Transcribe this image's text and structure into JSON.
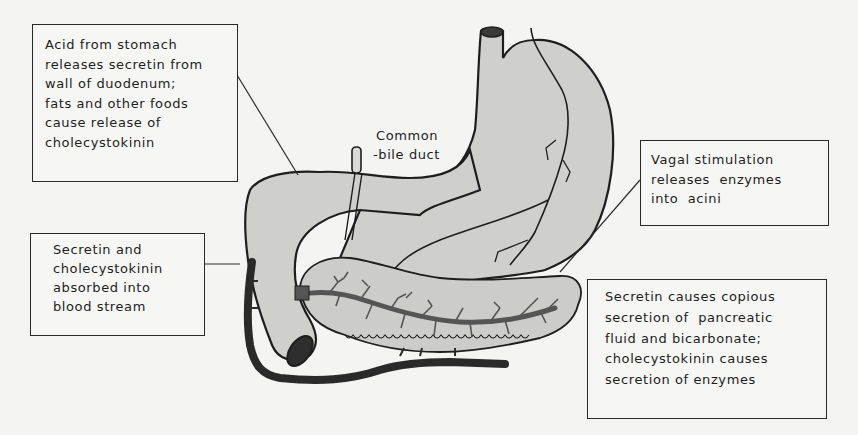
{
  "figure": {
    "structures": [
      "stomach",
      "esophagus",
      "duodenum",
      "pancreas",
      "pancreatic duct",
      "common bile duct",
      "blood vessel",
      "vagus nerve"
    ],
    "colors": {
      "paper": "#f4f4f2",
      "organ_fill": "#cfcfcc",
      "outline": "#1e1e1e",
      "duct": "#555555",
      "vessel": "#2a2a2a"
    }
  },
  "labels": {
    "acid_box": {
      "lines": [
        "Acid from stomach",
        "releases secretin from",
        "wall of duodenum;",
        "fats and other foods",
        "cause release of",
        "cholecystokinin"
      ]
    },
    "blood_box": {
      "lines": [
        "Secretin and",
        "cholecystokinin",
        "absorbed into",
        "blood stream"
      ]
    },
    "bile_duct": {
      "lines": [
        "Common",
        "-bile duct"
      ]
    },
    "vagal_box": {
      "lines": [
        "Vagal stimulation",
        "releases  enzymes",
        "into  acini"
      ]
    },
    "secretin_box": {
      "lines": [
        "Secretin causes copious",
        "secretion of  pancreatic",
        "fluid and bicarbonate;",
        "cholecystokinin causes",
        "secretion of enzymes"
      ]
    }
  }
}
